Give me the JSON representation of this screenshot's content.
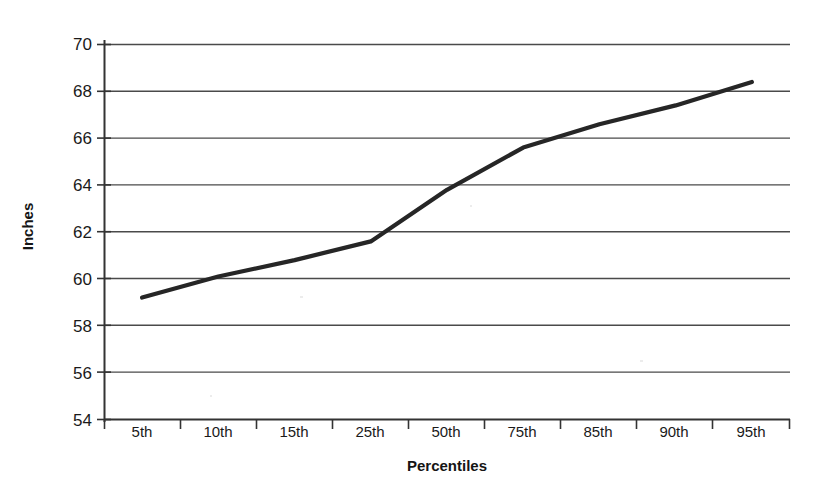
{
  "chart_data": {
    "type": "line",
    "title": "",
    "subtitle": "",
    "xlabel": "Percentiles",
    "ylabel": "Inches",
    "categories": [
      "5th",
      "10th",
      "15th",
      "25th",
      "50th",
      "75th",
      "85th",
      "90th",
      "95th"
    ],
    "values": [
      59.2,
      60.1,
      60.8,
      61.6,
      63.8,
      65.6,
      66.6,
      67.4,
      68.4
    ],
    "series": [
      {
        "name": "Height",
        "values": [
          59.2,
          60.1,
          60.8,
          61.6,
          63.8,
          65.6,
          66.6,
          67.4,
          68.4
        ]
      }
    ],
    "ylim": [
      54,
      70
    ],
    "yticks": [
      54,
      56,
      58,
      60,
      62,
      64,
      66,
      68,
      70
    ],
    "ytick_labels": [
      "54",
      "56",
      "58",
      "60",
      "62",
      "64",
      "66",
      "68",
      "70"
    ],
    "grid": true,
    "grid_axis": "y",
    "legend": false,
    "legend_position": "none",
    "line_color": "#262626",
    "grid_color": "#555555",
    "axis_color": "#333333",
    "background_color": "#ffffff",
    "markers": false,
    "annotations": []
  },
  "axis": {
    "y_title": "Inches",
    "x_title": "Percentiles"
  }
}
